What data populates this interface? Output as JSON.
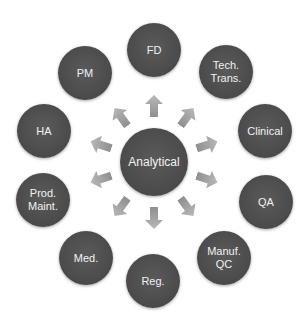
{
  "center": {
    "label": "Analytical",
    "x": 154,
    "y": 162,
    "r": 34
  },
  "nodes": [
    {
      "id": "fd",
      "label": "FD",
      "x": 154,
      "y": 50,
      "angle": 0
    },
    {
      "id": "tech-trans",
      "label": "Tech.\nTrans.",
      "x": 226,
      "y": 72,
      "angle": 36
    },
    {
      "id": "clinical",
      "label": "Clinical",
      "x": 265,
      "y": 131,
      "angle": 72
    },
    {
      "id": "qa",
      "label": "QA",
      "x": 266,
      "y": 202,
      "angle": 108
    },
    {
      "id": "manuf-qc",
      "label": "Manuf.\nQC",
      "x": 224,
      "y": 258,
      "angle": 144
    },
    {
      "id": "reg",
      "label": "Reg.",
      "x": 153,
      "y": 281,
      "angle": 180
    },
    {
      "id": "med",
      "label": "Med.",
      "x": 86,
      "y": 258,
      "angle": 216
    },
    {
      "id": "prod-maint",
      "label": "Prod.\nMaint.",
      "x": 43,
      "y": 200,
      "angle": 252
    },
    {
      "id": "ha",
      "label": "HA",
      "x": 44,
      "y": 131,
      "angle": 288
    },
    {
      "id": "pm",
      "label": "PM",
      "x": 85,
      "y": 73,
      "angle": 324
    }
  ],
  "node_radius": 27,
  "colors": {
    "node": "#4a4a4a",
    "arrow": "#a6a6a6",
    "text": "#f2f2f2"
  }
}
